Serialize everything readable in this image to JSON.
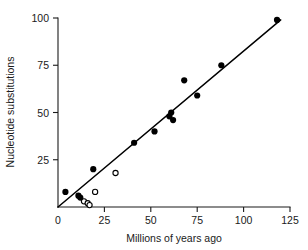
{
  "chart_data": {
    "type": "scatter",
    "title": "",
    "subtitle": "",
    "xlabel": "Millions of years ago",
    "ylabel": "Nucleotide substitutions",
    "xlim": [
      0,
      125
    ],
    "ylim": [
      0,
      100
    ],
    "xticks": [
      0,
      25,
      50,
      75,
      100,
      125
    ],
    "yticks": [
      0,
      25,
      50,
      75,
      100
    ],
    "xtick_labels": [
      "0",
      "25",
      "50",
      "75",
      "100",
      "125"
    ],
    "ytick_labels": [
      "0",
      "25",
      "50",
      "75",
      "100"
    ],
    "grid": false,
    "legend": null,
    "legend_position": "none",
    "colors": {
      "filled_marker": "#000000",
      "open_marker_stroke": "#000000",
      "open_marker_fill": "#ffffff",
      "axis": "#1a1a1a",
      "fit_line": "#000000",
      "background": "#ffffff"
    },
    "series": [
      {
        "name": "filled-points",
        "marker": "filled-circle",
        "points": [
          {
            "x": 4,
            "y": 8
          },
          {
            "x": 11,
            "y": 6
          },
          {
            "x": 12,
            "y": 5
          },
          {
            "x": 19,
            "y": 20
          },
          {
            "x": 41,
            "y": 34
          },
          {
            "x": 52,
            "y": 40
          },
          {
            "x": 60,
            "y": 48
          },
          {
            "x": 61,
            "y": 50
          },
          {
            "x": 62,
            "y": 46
          },
          {
            "x": 68,
            "y": 67
          },
          {
            "x": 75,
            "y": 59
          },
          {
            "x": 88,
            "y": 75
          },
          {
            "x": 118,
            "y": 99
          }
        ]
      },
      {
        "name": "open-points",
        "marker": "open-circle",
        "points": [
          {
            "x": 14,
            "y": 3
          },
          {
            "x": 16,
            "y": 2
          },
          {
            "x": 17,
            "y": 1
          },
          {
            "x": 20,
            "y": 8
          },
          {
            "x": 31,
            "y": 18
          }
        ]
      }
    ],
    "fit_line": {
      "name": "regression-line",
      "x0": 0,
      "y0": 0,
      "x1": 120,
      "y1": 99
    }
  }
}
